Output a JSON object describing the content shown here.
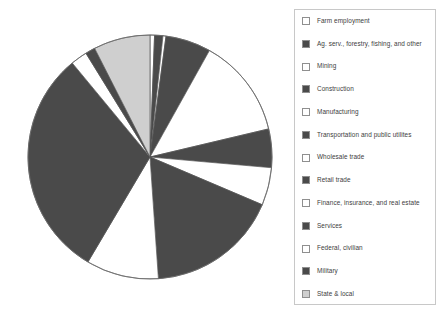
{
  "chart_data": {
    "type": "pie",
    "title": "",
    "subtitle": "",
    "xlabel": "",
    "ylabel": "",
    "grid": false,
    "legend_position": "right",
    "start_angle_deg": 90,
    "direction": "clockwise",
    "categories": [
      "Farm employment",
      "Ag. serv., forestry, fishing, and other",
      "Mining",
      "Construction",
      "Manufacturing",
      "Transportation and public utilites",
      "Wholesale trade",
      "Retail trade",
      "Finance, insurance, and real estate",
      "Services",
      "Federal, civilian",
      "Military",
      "State & local"
    ],
    "values": [
      0.6,
      1.1,
      0.4,
      6.0,
      13.2,
      5.1,
      5.0,
      17.5,
      9.6,
      30.5,
      2.2,
      1.3,
      7.5
    ],
    "units": "percent of total employment",
    "colors": [
      "#ffffff",
      "#4a4a4a",
      "#ffffff",
      "#4a4a4a",
      "#ffffff",
      "#4a4a4a",
      "#ffffff",
      "#4a4a4a",
      "#ffffff",
      "#4a4a4a",
      "#ffffff",
      "#4a4a4a",
      "#cfcfcf"
    ],
    "slice_edge_color": "#555555",
    "legend_border_color": "#c8c8c8",
    "legend_text_color": "#3d3d3d"
  },
  "legend": {
    "items": [
      {
        "label": "Farm employment",
        "swatch": "#ffffff"
      },
      {
        "label": "Ag. serv., forestry, fishing, and other",
        "swatch": "#4a4a4a"
      },
      {
        "label": "Mining",
        "swatch": "#ffffff"
      },
      {
        "label": "Construction",
        "swatch": "#4a4a4a"
      },
      {
        "label": "Manufacturing",
        "swatch": "#ffffff"
      },
      {
        "label": "Transportation and public utilites",
        "swatch": "#4a4a4a"
      },
      {
        "label": "Wholesale trade",
        "swatch": "#ffffff"
      },
      {
        "label": "Retail trade",
        "swatch": "#4a4a4a"
      },
      {
        "label": "Finance, insurance, and real estate",
        "swatch": "#ffffff"
      },
      {
        "label": "Services",
        "swatch": "#4a4a4a"
      },
      {
        "label": "Federal, civilian",
        "swatch": "#ffffff"
      },
      {
        "label": "Military",
        "swatch": "#4a4a4a"
      },
      {
        "label": "State & local",
        "swatch": "#cfcfcf"
      }
    ]
  }
}
